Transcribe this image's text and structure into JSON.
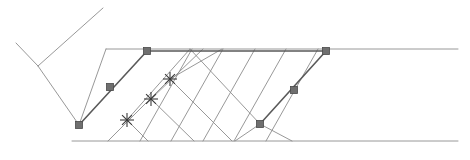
{
  "figure": {
    "name": "ray-path-diagram",
    "title": "",
    "background_color": "#ffffff",
    "width": 470,
    "height": 160
  },
  "style": {
    "line_color": "#8c8c8c",
    "line_color_dark": "#6e6e6e",
    "highlight_color": "#5a5a5a",
    "marker_square_fill": "#6f6f6f",
    "marker_square_stroke": "#4a4a4a",
    "marker_star_color": "#3a3a3a",
    "line_width": 0.9,
    "highlight_line_width": 1.6,
    "square_size": 7,
    "star_radius": 7
  },
  "chart_data": {
    "type": "line",
    "title": "",
    "xlabel": "",
    "ylabel": "",
    "grid": false,
    "legend": null,
    "xlim": [
      0,
      470
    ],
    "ylim": [
      0,
      160
    ],
    "background_lines": [
      {
        "name": "upper-left-long-diagonal",
        "points": [
          [
            38,
            66
          ],
          [
            103,
            8
          ]
        ]
      },
      {
        "name": "upper-left-short-diagonal",
        "points": [
          [
            38,
            66
          ],
          [
            16,
            43
          ]
        ]
      },
      {
        "name": "left-descending-diagonal",
        "points": [
          [
            38,
            66
          ],
          [
            79,
            125
          ]
        ]
      },
      {
        "name": "top-horizontal-band-edge",
        "points": [
          [
            106,
            49
          ],
          [
            458,
            49
          ]
        ]
      },
      {
        "name": "bottom-horizontal-band-edge",
        "points": [
          [
            72,
            141
          ],
          [
            458,
            141
          ]
        ]
      },
      {
        "name": "band-left-upper-diagonal",
        "points": [
          [
            106,
            49
          ],
          [
            79,
            125
          ]
        ]
      },
      {
        "name": "fan-diagonal-1",
        "points": [
          [
            140,
            141
          ],
          [
            192,
            49
          ]
        ]
      },
      {
        "name": "fan-diagonal-2",
        "points": [
          [
            171,
            141
          ],
          [
            223,
            49
          ]
        ]
      },
      {
        "name": "fan-diagonal-3",
        "points": [
          [
            203,
            141
          ],
          [
            255,
            49
          ]
        ]
      },
      {
        "name": "fan-diagonal-4",
        "points": [
          [
            234,
            141
          ],
          [
            286,
            49
          ]
        ]
      },
      {
        "name": "fan-diagonal-5",
        "points": [
          [
            266,
            141
          ],
          [
            318,
            49
          ]
        ]
      },
      {
        "name": "reflect-diagonal-1",
        "points": [
          [
            108,
            141
          ],
          [
            170,
            79
          ]
        ]
      },
      {
        "name": "reflect-diagonal-2",
        "points": [
          [
            127,
            120
          ],
          [
            190,
            49
          ]
        ]
      },
      {
        "name": "reflect-diagonal-3",
        "points": [
          [
            151,
            99
          ],
          [
            203,
            49
          ]
        ]
      },
      {
        "name": "reflect-diagonal-4",
        "points": [
          [
            170,
            79
          ],
          [
            222,
            49
          ]
        ]
      },
      {
        "name": "reflect-diagonal-down-1",
        "points": [
          [
            127,
            120
          ],
          [
            148,
            141
          ]
        ]
      },
      {
        "name": "reflect-diagonal-down-2",
        "points": [
          [
            151,
            99
          ],
          [
            194,
            141
          ]
        ]
      },
      {
        "name": "reflect-diagonal-down-3",
        "points": [
          [
            170,
            79
          ],
          [
            232,
            141
          ]
        ]
      },
      {
        "name": "reflect-diagonal-down-4",
        "points": [
          [
            190,
            49
          ],
          [
            260,
            124
          ]
        ]
      },
      {
        "name": "right-lower-diagonal-1",
        "points": [
          [
            260,
            124
          ],
          [
            235,
            141
          ]
        ]
      },
      {
        "name": "right-lower-diagonal-2",
        "points": [
          [
            260,
            124
          ],
          [
            292,
            141
          ]
        ]
      }
    ],
    "ray_path": {
      "name": "highlighted-ray",
      "color": "#5a5a5a",
      "points": [
        [
          79,
          125
        ],
        [
          110,
          87
        ],
        [
          147,
          51
        ],
        [
          326,
          51
        ],
        [
          294,
          90
        ],
        [
          260,
          124
        ]
      ],
      "segments": [
        {
          "from": [
            79,
            125
          ],
          "to": [
            147,
            51
          ],
          "label": "upgoing-left-leg"
        },
        {
          "from": [
            147,
            51
          ],
          "to": [
            326,
            51
          ],
          "label": "horizontal-leg"
        },
        {
          "from": [
            326,
            51
          ],
          "to": [
            260,
            124
          ],
          "label": "downgoing-right-leg"
        }
      ]
    },
    "square_markers": [
      {
        "name": "marker-square-1",
        "x": 79,
        "y": 125
      },
      {
        "name": "marker-square-2",
        "x": 110,
        "y": 87
      },
      {
        "name": "marker-square-3",
        "x": 147,
        "y": 51
      },
      {
        "name": "marker-square-4",
        "x": 326,
        "y": 51
      },
      {
        "name": "marker-square-5",
        "x": 294,
        "y": 90
      },
      {
        "name": "marker-square-6",
        "x": 260,
        "y": 124
      }
    ],
    "star_markers": [
      {
        "name": "marker-star-1",
        "x": 127,
        "y": 120
      },
      {
        "name": "marker-star-2",
        "x": 151,
        "y": 99
      },
      {
        "name": "marker-star-3",
        "x": 170,
        "y": 79
      }
    ]
  }
}
